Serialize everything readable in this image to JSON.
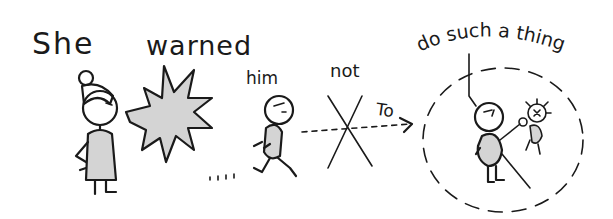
{
  "caption": {
    "words": [
      "She",
      "warned",
      "him",
      "not",
      "to",
      "do such a thing"
    ]
  },
  "labels": {
    "she": "She",
    "warned": "warned",
    "him": "him",
    "not": "not",
    "to": "To",
    "do_such_a_thing": "do such a thing",
    "burst_text": "NO!",
    "trail": "..."
  },
  "colors": {
    "ink": "#1a1a1a",
    "fill": "#d4d4d4",
    "background": "#ffffff"
  }
}
